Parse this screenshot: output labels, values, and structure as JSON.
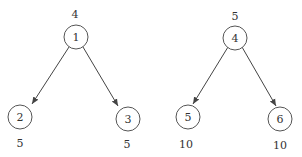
{
  "trees": [
    {
      "root": {
        "label": "1",
        "weight": "4"
      },
      "children": [
        {
          "label": "2",
          "weight": "5"
        },
        {
          "label": "3",
          "weight": "5"
        }
      ]
    },
    {
      "root": {
        "label": "4",
        "weight": "5"
      },
      "children": [
        {
          "label": "5",
          "weight": "10"
        },
        {
          "label": "6",
          "weight": "10"
        }
      ]
    }
  ],
  "colors": {
    "stroke": "#444444",
    "text": "#333333"
  }
}
